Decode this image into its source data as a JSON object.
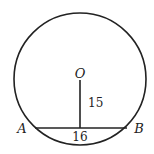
{
  "diagram": {
    "type": "circle-chord",
    "circle": {
      "center_label": "O",
      "cx": 80,
      "cy": 79,
      "r": 66
    },
    "chord": {
      "endpoints": [
        "A",
        "B"
      ],
      "length_label": "16",
      "y": 128,
      "x1": 35,
      "x2": 127
    },
    "perpendicular": {
      "length_label": "15",
      "from": "O",
      "to": "chord midpoint"
    },
    "labels": {
      "center": "O",
      "left_point": "A",
      "right_point": "B",
      "chord_length": "16",
      "distance": "15"
    },
    "stroke_color": "#222222"
  }
}
